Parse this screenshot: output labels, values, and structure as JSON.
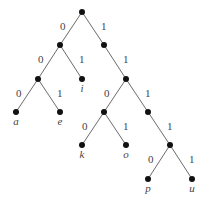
{
  "diagram": {
    "type": "binary-code-tree",
    "nodes": [
      {
        "id": "root",
        "x": 82,
        "y": 12
      },
      {
        "id": "n0",
        "x": 60,
        "y": 45
      },
      {
        "id": "n1",
        "x": 104,
        "y": 45
      },
      {
        "id": "n00",
        "x": 38,
        "y": 79
      },
      {
        "id": "n01",
        "x": 82,
        "y": 79,
        "label": "i"
      },
      {
        "id": "n11",
        "x": 126,
        "y": 79
      },
      {
        "id": "n000",
        "x": 16,
        "y": 112,
        "label": "a"
      },
      {
        "id": "n001",
        "x": 60,
        "y": 112,
        "label": "e"
      },
      {
        "id": "n110",
        "x": 104,
        "y": 112
      },
      {
        "id": "n111",
        "x": 148,
        "y": 112
      },
      {
        "id": "n1100",
        "x": 82,
        "y": 145,
        "label": "k"
      },
      {
        "id": "n1101",
        "x": 126,
        "y": 145,
        "label": "o"
      },
      {
        "id": "n1111",
        "x": 170,
        "y": 145
      },
      {
        "id": "n11110",
        "x": 148,
        "y": 179,
        "label": "p"
      },
      {
        "id": "n11111",
        "x": 192,
        "y": 179,
        "label": "u"
      }
    ],
    "edges": [
      {
        "from": "root",
        "to": "n0",
        "bit": "0"
      },
      {
        "from": "root",
        "to": "n1",
        "bit": "1"
      },
      {
        "from": "n0",
        "to": "n00",
        "bit": "0"
      },
      {
        "from": "n0",
        "to": "n01",
        "bit": "1"
      },
      {
        "from": "n1",
        "to": "n11",
        "bit": "1"
      },
      {
        "from": "n00",
        "to": "n000",
        "bit": "0"
      },
      {
        "from": "n00",
        "to": "n001",
        "bit": "1"
      },
      {
        "from": "n11",
        "to": "n110",
        "bit": "0"
      },
      {
        "from": "n11",
        "to": "n111",
        "bit": "1"
      },
      {
        "from": "n110",
        "to": "n1100",
        "bit": "0"
      },
      {
        "from": "n110",
        "to": "n1101",
        "bit": "1"
      },
      {
        "from": "n111",
        "to": "n1111",
        "bit": "1"
      },
      {
        "from": "n1111",
        "to": "n11110",
        "bit": "0"
      },
      {
        "from": "n1111",
        "to": "n11111",
        "bit": "1"
      }
    ],
    "leaf_codes": {
      "a": "000",
      "e": "001",
      "i": "01",
      "k": "1100",
      "o": "1101",
      "p": "11110",
      "u": "11111"
    }
  }
}
